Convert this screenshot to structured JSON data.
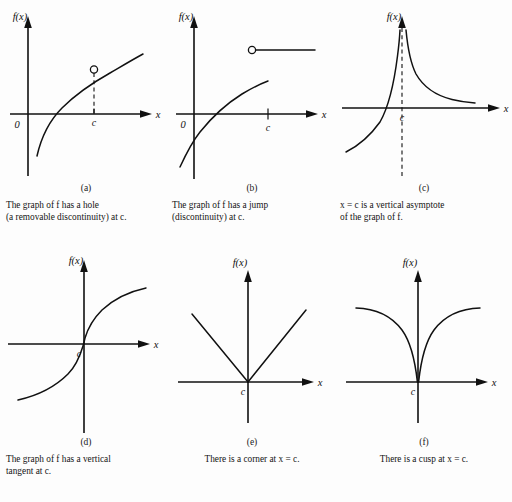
{
  "figure": {
    "background_color": "#fdfdfd",
    "ink_color": "#111111",
    "axis_labels": {
      "y": "f(x)",
      "x": "x",
      "origin": "0",
      "point": "c"
    }
  },
  "panels": [
    {
      "id": "a",
      "letter": "(a)",
      "caption": "The graph of f has a hole\n(a removable discontinuity) at c.",
      "caption_align": "left",
      "graph_type": "logarithmic-curve-with-hole",
      "features": [
        "increasing concave-down curve",
        "open circle at x = c",
        "dashed drop line to axis",
        "origin label 0",
        "tick at c"
      ],
      "show_origin_label": true,
      "show_hole": true,
      "show_dashed_drop": true
    },
    {
      "id": "b",
      "letter": "(b)",
      "caption": "The graph of f has a jump\n(discontinuity) at c.",
      "caption_align": "left",
      "graph_type": "jump-discontinuity",
      "features": [
        "increasing concave-down curve ending at c",
        "open circle beginning horizontal ray above",
        "origin label 0",
        "tick at c"
      ],
      "show_origin_label": true
    },
    {
      "id": "c",
      "letter": "(c)",
      "caption": "x = c is a vertical asymptote\nof the graph of f.",
      "caption_align": "left",
      "graph_type": "vertical-asymptote",
      "features": [
        "dashed vertical asymptote at c",
        "left branch rising to +infinity",
        "right branch decreasing from +infinity",
        "label c on axis"
      ],
      "show_origin_label": false
    },
    {
      "id": "d",
      "letter": "(d)",
      "caption": "The graph of f has a vertical\ntangent at c.",
      "caption_align": "left",
      "graph_type": "vertical-tangent",
      "features": [
        "cube-root shaped curve through c",
        "steep slope at c",
        "label c on axis"
      ],
      "show_origin_label": false
    },
    {
      "id": "e",
      "letter": "(e)",
      "caption": "There is a corner at x = c.",
      "caption_align": "center",
      "graph_type": "corner",
      "features": [
        "V shape with vertex on the x-axis at c",
        "two straight rays",
        "label c on axis"
      ],
      "show_origin_label": false
    },
    {
      "id": "f",
      "letter": "(f)",
      "caption": "There is a cusp at x = c.",
      "caption_align": "center",
      "graph_type": "cusp",
      "features": [
        "two concave-down branches meeting vertically at c",
        "cusp point on the x-axis",
        "label c on axis"
      ],
      "show_origin_label": false
    }
  ]
}
